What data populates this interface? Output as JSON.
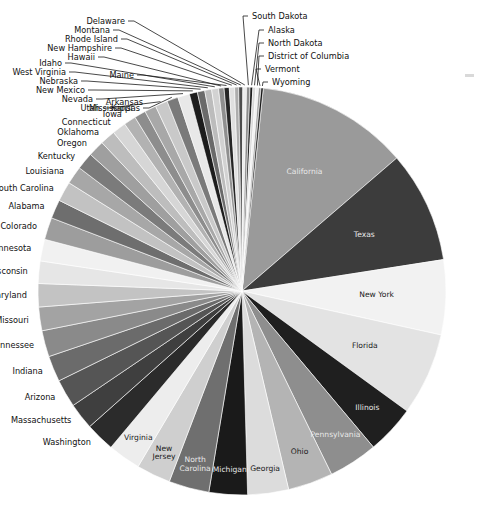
{
  "figure": {
    "kind": "pie-chart",
    "background": "#ffffff",
    "center_x": 242,
    "center_y": 291,
    "radius": 204,
    "start_angle_deg": -84,
    "direction": "clockwise"
  },
  "chart_data": {
    "type": "pie",
    "title": "",
    "subtitle": "",
    "xlabel": "",
    "ylabel": "",
    "grid": false,
    "legend": "none",
    "label_mode": "inside-for-large-slices, leader-lines-for-small-slices",
    "categories": [
      "California",
      "Texas",
      "New York",
      "Florida",
      "Illinois",
      "Pennsylvania",
      "Ohio",
      "Georgia",
      "Michigan",
      "North Carolina",
      "New Jersey",
      "Virginia",
      "Washington",
      "Massachusetts",
      "Arizona",
      "Indiana",
      "Tennessee",
      "Missouri",
      "Maryland",
      "Wisconsin",
      "Minnesota",
      "Colorado",
      "Alabama",
      "South Carolina",
      "Louisiana",
      "Kentucky",
      "Oregon",
      "Oklahoma",
      "Connecticut",
      "Iowa",
      "Mississippi",
      "Arkansas",
      "Utah",
      "Kansas",
      "Nevada",
      "New Mexico",
      "Nebraska",
      "West Virginia",
      "Idaho",
      "Hawaii",
      "Maine",
      "New Hampshire",
      "Rhode Island",
      "Montana",
      "Delaware",
      "South Dakota",
      "Alaska",
      "North Dakota",
      "District of Columbia",
      "Vermont",
      "Wyoming"
    ],
    "values": [
      39.51,
      29.0,
      19.45,
      21.48,
      12.67,
      12.8,
      11.69,
      10.62,
      9.99,
      10.49,
      8.88,
      8.54,
      7.61,
      6.89,
      7.28,
      6.73,
      6.83,
      6.14,
      6.05,
      5.82,
      5.64,
      5.76,
      4.9,
      5.15,
      4.65,
      4.47,
      4.22,
      3.96,
      3.57,
      3.16,
      2.98,
      3.02,
      3.21,
      2.91,
      3.08,
      2.1,
      1.93,
      1.79,
      1.79,
      1.42,
      1.34,
      1.36,
      1.06,
      1.07,
      0.97,
      0.88,
      0.73,
      0.76,
      0.71,
      0.62,
      0.58
    ],
    "value_unit": "millions",
    "total": 328.2,
    "colors": [
      "#9a9a9a",
      "#3c3c3c",
      "#f2f2f2",
      "#e3e3e3",
      "#1f1f1f",
      "#8e8e8e",
      "#b4b4b4",
      "#dcdcdc",
      "#1a1a1a",
      "#6f6f6f",
      "#cfcfcf",
      "#ededed",
      "#2b2b2b",
      "#3f3f3f",
      "#555555",
      "#6b6b6b",
      "#8a8a8a",
      "#a3a3a3",
      "#c3c3c3",
      "#e6e6e6",
      "#f1f1f1",
      "#9d9d9d",
      "#6e6e6e",
      "#c2c2c2",
      "#a7a7a7",
      "#7b7b7b",
      "#9f9f9f",
      "#bdbdbd",
      "#d6d6d6",
      "#b2b2b2",
      "#8d8d8d",
      "#a8a8a8",
      "#c9c9c9",
      "#7a7a7a",
      "#e8e8e8",
      "#1c1c1c",
      "#6a6a6a",
      "#bcbcbc",
      "#d2d2d2",
      "#8f8f8f",
      "#252525",
      "#e0e0e0",
      "#adadad",
      "#4c4c4c",
      "#ececec",
      "#8b8b8b",
      "#1e1e1e",
      "#d8d8d8",
      "#f0f0f0",
      "#9b9b9b",
      "#171717"
    ]
  },
  "inside_labels": [
    {
      "name": "California",
      "color": "#e8e8e8"
    },
    {
      "name": "Texas",
      "color": "#e8e8e8"
    },
    {
      "name": "New York",
      "color": "#1a1a1a"
    },
    {
      "name": "Florida",
      "color": "#1a1a1a"
    },
    {
      "name": "Illinois",
      "color": "#e8e8e8"
    },
    {
      "name": "Pennsylvania",
      "color": "#e8e8e8"
    },
    {
      "name": "Ohio",
      "color": "#1a1a1a"
    },
    {
      "name": "Georgia",
      "color": "#1a1a1a"
    },
    {
      "name": "Michigan",
      "color": "#e8e8e8"
    },
    {
      "name": "North Carolina",
      "color": "#e8e8e8"
    },
    {
      "name": "New Jersey",
      "color": "#1a1a1a"
    },
    {
      "name": "Virginia",
      "color": "#1a1a1a"
    }
  ],
  "outside_labels_left": [
    "Washington",
    "Massachusetts",
    "Arizona",
    "Indiana",
    "Tennessee",
    "Missouri",
    "Maryland",
    "Wisconsin",
    "Minnesota",
    "Colorado",
    "Alabama",
    "South Carolina",
    "Louisiana",
    "Kentucky",
    "Oregon",
    "Oklahoma",
    "Connecticut",
    "Iowa",
    "Mississippi",
    "Arkansas",
    "Utah",
    "Kansas",
    "Nevada",
    "New Mexico",
    "Nebraska",
    "West Virginia",
    "Idaho",
    "Hawaii",
    "Maine",
    "New Hampshire",
    "Rhode Island",
    "Montana",
    "Delaware"
  ],
  "outside_labels_right": [
    "South Dakota",
    "Alaska",
    "North Dakota",
    "District of Columbia",
    "Vermont",
    "Wyoming"
  ]
}
